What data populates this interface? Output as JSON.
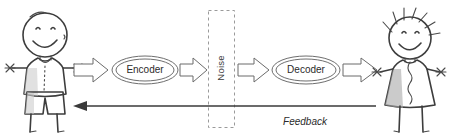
{
  "diagram": {
    "background_color": "#ffffff",
    "width": 453,
    "height": 137,
    "nodes": [
      {
        "id": "encoder",
        "label": "Encoder",
        "shape": "double-ellipse"
      },
      {
        "id": "noise",
        "label": "Noise",
        "shape": "dashed-rectangle",
        "orientation": "vertical"
      },
      {
        "id": "decoder",
        "label": "Decoder",
        "shape": "double-ellipse"
      }
    ],
    "actors": [
      {
        "id": "sender",
        "name": "sender-stick-figure",
        "side": "left"
      },
      {
        "id": "receiver",
        "name": "receiver-stick-figure",
        "side": "right"
      }
    ],
    "flow_arrows": [
      {
        "id": "arrow-sender-encoder",
        "from": "sender",
        "to": "encoder",
        "style": "hollow-block"
      },
      {
        "id": "arrow-encoder-noise",
        "from": "encoder",
        "to": "noise",
        "style": "hollow-block"
      },
      {
        "id": "arrow-noise-decoder",
        "from": "noise",
        "to": "decoder",
        "style": "hollow-block"
      },
      {
        "id": "arrow-decoder-receiver",
        "from": "decoder",
        "to": "receiver",
        "style": "hollow-block"
      }
    ],
    "feedback": {
      "label": "Feedback",
      "from": "receiver",
      "to": "sender",
      "style": "solid-line-arrow",
      "direction": "right-to-left",
      "italic": true
    },
    "colors": {
      "stroke": "#3a3a3a",
      "sketch": "#5a5a5a",
      "dashed": "#9a9a9a",
      "text": "#2b2b2b",
      "shading": "#c9c9c9"
    }
  }
}
